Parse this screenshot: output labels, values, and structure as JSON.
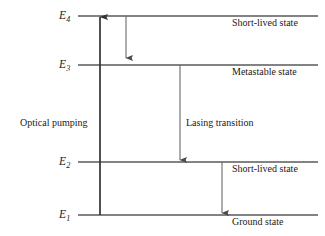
{
  "figure": {
    "type": "energy-level-diagram",
    "background_color": "#ffffff",
    "line_color": "#555555",
    "pump_arrow_color": "#333333",
    "text_color": "#1a1a1a"
  },
  "levels": [
    {
      "id": "E4",
      "symbol": "E",
      "subscript": "4",
      "state_label": "Short-lived state",
      "y": 16,
      "x_start": 78,
      "x_end": 318
    },
    {
      "id": "E3",
      "symbol": "E",
      "subscript": "3",
      "state_label": "Metastable state",
      "y": 65,
      "x_start": 78,
      "x_end": 318
    },
    {
      "id": "E2",
      "symbol": "E",
      "subscript": "2",
      "state_label": "Short-lived state",
      "y": 162,
      "x_start": 78,
      "x_end": 318
    },
    {
      "id": "E1",
      "symbol": "E",
      "subscript": "1",
      "state_label": "Ground state",
      "y": 215,
      "x_start": 78,
      "x_end": 318
    }
  ],
  "transitions": [
    {
      "id": "optical-pumping",
      "label": "Optical pumping",
      "direction": "up",
      "from": "E1",
      "to": "E4",
      "x": 100,
      "y_start": 215,
      "y_end": 17,
      "label_x": 20,
      "label_y": 118
    },
    {
      "id": "fast-decay-e4-e3",
      "label": "",
      "direction": "down",
      "from": "E4",
      "to": "E3",
      "x": 126,
      "y_start": 16,
      "y_end": 58,
      "label_x": 0,
      "label_y": 0
    },
    {
      "id": "lasing-transition",
      "label": "Lasing transition",
      "direction": "down",
      "from": "E3",
      "to": "E2",
      "x": 180,
      "y_start": 65,
      "y_end": 160,
      "label_x": 186,
      "label_y": 118
    },
    {
      "id": "fast-decay-e2-e1",
      "label": "",
      "direction": "down",
      "from": "E2",
      "to": "E1",
      "x": 222,
      "y_start": 162,
      "y_end": 213,
      "label_x": 0,
      "label_y": 0
    }
  ],
  "level_label_positions": [
    {
      "x": 59,
      "y": 10
    },
    {
      "x": 59,
      "y": 59
    },
    {
      "x": 59,
      "y": 156
    },
    {
      "x": 59,
      "y": 209
    }
  ],
  "state_label_positions": [
    {
      "x": 232,
      "y": 18
    },
    {
      "x": 232,
      "y": 67
    },
    {
      "x": 232,
      "y": 164
    },
    {
      "x": 232,
      "y": 217
    }
  ]
}
